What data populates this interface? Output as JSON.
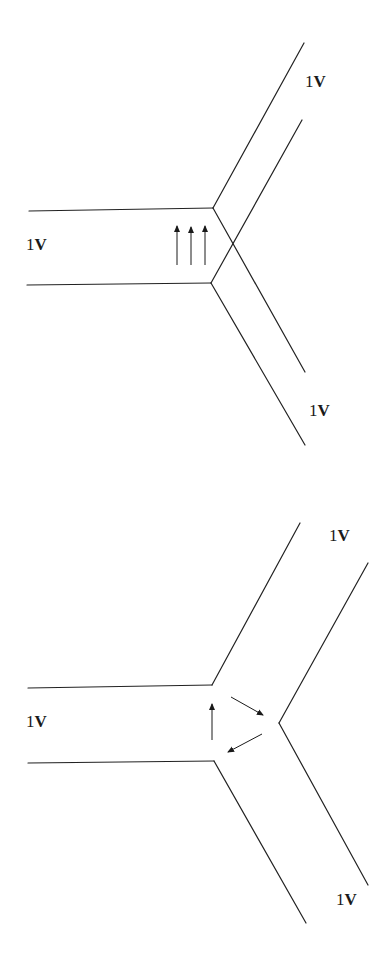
{
  "colors": {
    "background": "#ffffff",
    "line": "#222222",
    "arrow": "#1a1a1a",
    "text": "#1a1a1a"
  },
  "diagrams": [
    {
      "name": "top-junction",
      "description": "Three-branch junction with overlapping (crossing) inner edges; three parallel upward arrows in the left branch",
      "labels": [
        {
          "text_prefix": "1",
          "text_suffix": "V",
          "x": 305,
          "y": 73,
          "branch": "upper-right"
        },
        {
          "text_prefix": "1",
          "text_suffix": "V",
          "x": 26,
          "y": 236,
          "branch": "left"
        },
        {
          "text_prefix": "1",
          "text_suffix": "V",
          "x": 309,
          "y": 402,
          "branch": "lower-right"
        }
      ],
      "lines": [
        {
          "x1": 29,
          "y1": 211,
          "x2": 213,
          "y2": 208
        },
        {
          "x1": 27,
          "y1": 285,
          "x2": 211,
          "y2": 283
        },
        {
          "x1": 213,
          "y1": 208,
          "x2": 304,
          "y2": 43
        },
        {
          "x1": 302,
          "y1": 120,
          "x2": 211,
          "y2": 283
        },
        {
          "x1": 213,
          "y1": 208,
          "x2": 305,
          "y2": 372
        },
        {
          "x1": 211,
          "y1": 283,
          "x2": 305,
          "y2": 445
        }
      ],
      "arrows": [
        {
          "x1": 177,
          "y1": 265,
          "x2": 177,
          "y2": 226,
          "direction": "up"
        },
        {
          "x1": 191,
          "y1": 265,
          "x2": 191,
          "y2": 227,
          "direction": "up"
        },
        {
          "x1": 205,
          "y1": 265,
          "x2": 205,
          "y2": 226,
          "direction": "up"
        }
      ]
    },
    {
      "name": "bottom-junction",
      "description": "Three-branch junction with an open inner vertex; circulating arrows forming a triangle",
      "labels": [
        {
          "text_prefix": "1",
          "text_suffix": "V",
          "x": 329,
          "y": 527,
          "branch": "upper-right"
        },
        {
          "text_prefix": "1",
          "text_suffix": "V",
          "x": 26,
          "y": 713,
          "branch": "left"
        },
        {
          "text_prefix": "1",
          "text_suffix": "V",
          "x": 336,
          "y": 891,
          "branch": "lower-right"
        }
      ],
      "lines": [
        {
          "x1": 28,
          "y1": 688,
          "x2": 212,
          "y2": 685
        },
        {
          "x1": 28,
          "y1": 763,
          "x2": 214,
          "y2": 761
        },
        {
          "x1": 212,
          "y1": 685,
          "x2": 300,
          "y2": 523
        },
        {
          "x1": 368,
          "y1": 563,
          "x2": 279,
          "y2": 723
        },
        {
          "x1": 279,
          "y1": 723,
          "x2": 368,
          "y2": 885
        },
        {
          "x1": 214,
          "y1": 761,
          "x2": 306,
          "y2": 923
        }
      ],
      "arrows": [
        {
          "x1": 212,
          "y1": 740,
          "x2": 212,
          "y2": 704,
          "direction": "up"
        },
        {
          "x1": 231,
          "y1": 697,
          "x2": 263,
          "y2": 715,
          "direction": "down-right"
        },
        {
          "x1": 262,
          "y1": 734,
          "x2": 228,
          "y2": 752,
          "direction": "down-left"
        }
      ]
    }
  ]
}
